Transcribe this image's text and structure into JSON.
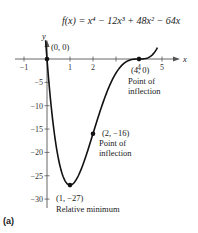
{
  "chart_data": {
    "type": "line",
    "title": "f(x) = x⁴ − 12x³ + 48x² − 64x",
    "xlabel": "x",
    "ylabel": "y",
    "xlim": [
      -1.1,
      5.6
    ],
    "ylim": [
      -31,
      4
    ],
    "x_ticks": [
      -1,
      1,
      2,
      3,
      4,
      5
    ],
    "x_tick_labels": [
      "−1",
      "1",
      "2",
      "",
      "4",
      "5"
    ],
    "y_ticks": [
      -5,
      -10,
      -15,
      -20,
      -25,
      -30
    ],
    "y_tick_labels": [
      "−5",
      "−10",
      "−15",
      "−20",
      "−25",
      "−30"
    ],
    "function": {
      "coefficients": [
        1,
        -12,
        48,
        -64,
        0
      ],
      "x_range": [
        -0.06,
        4.8
      ]
    },
    "grid": false,
    "points": [
      {
        "x": 0,
        "y": 0,
        "label": "(0, 0)",
        "note": ""
      },
      {
        "x": 1,
        "y": -27,
        "label": "(1, −27)",
        "note": "Relative minimum"
      },
      {
        "x": 2,
        "y": -16,
        "label": "(2, −16)",
        "note": "Point of inflection"
      },
      {
        "x": 4,
        "y": 0,
        "label": "(4, 0)",
        "note": "Point of inflection"
      }
    ]
  },
  "labels": {
    "title": "f(x) = x⁴ − 12x³ + 48x² − 64x",
    "x_axis": "x",
    "y_axis": "y",
    "p0": "(0, 0)",
    "p1": "(1, −27)",
    "p1_note": "Relative minimum",
    "p2": "(2, −16)",
    "p2_note_1": "Point of",
    "p2_note_2": "inflection",
    "p4": "(4, 0)",
    "p4_note_1": "Point of",
    "p4_note_2": "inflection",
    "panel": "(a)"
  }
}
